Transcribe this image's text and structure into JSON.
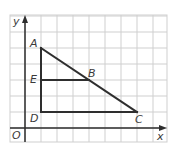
{
  "figure": {
    "grid": {
      "origin_px": [
        25,
        128
      ],
      "cell_px": 16,
      "left_px": 10,
      "top_px": 15,
      "right_px": 167,
      "bottom_px": 142,
      "grid_color": "#cfcfcf",
      "line_color": "#2e2e2e"
    },
    "axes": {
      "x_label": "x",
      "y_label": "y",
      "origin_label": "O"
    },
    "points": [
      {
        "name": "A",
        "x": 1,
        "y": 5
      },
      {
        "name": "B",
        "x": 4,
        "y": 3
      },
      {
        "name": "C",
        "x": 7,
        "y": 1
      },
      {
        "name": "D",
        "x": 1,
        "y": 1
      },
      {
        "name": "E",
        "x": 1,
        "y": 3
      }
    ],
    "segments": [
      [
        "A",
        "C"
      ],
      [
        "A",
        "D"
      ],
      [
        "D",
        "C"
      ],
      [
        "E",
        "B"
      ]
    ],
    "labels": {
      "A": "A",
      "B": "B",
      "C": "C",
      "D": "D",
      "E": "E"
    }
  }
}
